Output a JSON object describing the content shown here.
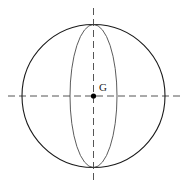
{
  "figure": {
    "background_color": "#ffffff",
    "width": 190,
    "height": 191
  },
  "labels": {
    "center_point": "G"
  },
  "colors": {
    "outline": "#1a1a1a",
    "ellipse": "#4a4a4a",
    "axis": "#555555",
    "point": "#000000",
    "background": "#ffffff"
  },
  "geometry": {
    "sphere_outline": {
      "shape": "circle",
      "cx": 93.5,
      "cy": 96,
      "r": 71.5,
      "stroke_width": 1.1
    },
    "great_circle": {
      "shape": "ellipse",
      "cx": 93.5,
      "cy": 96,
      "rx": 23.5,
      "ry": 71.5,
      "stroke_width": 0.9
    },
    "horizontal_axis": {
      "x1": 8,
      "y1": 96,
      "x2": 181,
      "y2": 96,
      "dash": "7,4",
      "stroke_width": 1.0
    },
    "vertical_axis": {
      "x1": 93.5,
      "y1": 8,
      "x2": 93.5,
      "y2": 183,
      "dash": "7,4",
      "stroke_width": 1.0
    },
    "center_dot": {
      "cx": 93.5,
      "cy": 96,
      "r": 2.6
    },
    "center_label_position": {
      "x": 99,
      "y": 91
    }
  }
}
